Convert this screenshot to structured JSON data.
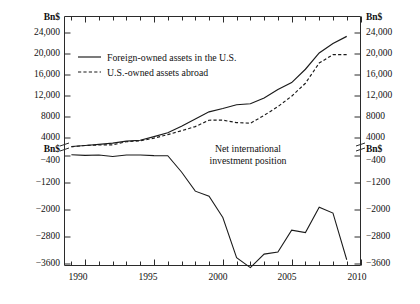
{
  "chart_data": {
    "type": "line",
    "title": "",
    "xlabel": "",
    "ylabel": "Bn$",
    "unit_label": "Bn$",
    "grid": false,
    "legend_position": "upper-left-inside",
    "axis_break": true,
    "axis_break_note": "Y axis broken between 4000 and -400; 'Bn$' unit label repeated at each segment top",
    "xlim": [
      1988.5,
      2010
    ],
    "x_major_ticks": [
      1990,
      1995,
      2000,
      2005,
      2010
    ],
    "x_major_tick_labels": [
      "1990",
      "1995",
      "2000",
      "2005",
      "2010"
    ],
    "x_minor_tick_step": 1,
    "y_upper_ticks": [
      4000,
      8000,
      12000,
      16000,
      20000,
      24000
    ],
    "y_upper_tick_labels": [
      "4000",
      "8000",
      "12,000",
      "16,000",
      "20,000",
      "24,000"
    ],
    "y_lower_ticks": [
      -400,
      -1200,
      -2000,
      -2800,
      -3600
    ],
    "y_lower_tick_labels": [
      "−400",
      "−1200",
      "−2000",
      "−2800",
      "−3600"
    ],
    "left_axis_unit": "Bn$",
    "right_axis_unit": "Bn$",
    "annotations": [
      {
        "text_line1": "Net international",
        "text_line2": "investment position",
        "x": 2001.2,
        "series": "Net international investment position"
      }
    ],
    "x": [
      1989,
      1990,
      1991,
      1992,
      1993,
      1994,
      1995,
      1996,
      1997,
      1998,
      1999,
      2000,
      2001,
      2002,
      2003,
      2004,
      2005,
      2006,
      2007,
      2008,
      2009
    ],
    "series": [
      {
        "name": "Foreign-owned assets in the U.S.",
        "style": "solid",
        "color": "#1a1a1a",
        "values": [
          1929,
          2179,
          2429,
          2744,
          3236,
          3451,
          4271,
          4988,
          6252,
          7615,
          8983,
          9616,
          10343,
          10515,
          11616,
          13219,
          14559,
          17098,
          20194,
          21980,
          23357
        ]
      },
      {
        "name": "U.S.-owned assets abroad",
        "style": "dashed",
        "color": "#1a1a1a",
        "values": [
          1838,
          2179,
          2286,
          2331,
          3091,
          3315,
          3964,
          4650,
          5379,
          6174,
          7390,
          7394,
          6930,
          6807,
          8309,
          9973,
          11962,
          14428,
          18278,
          19888,
          19883
        ]
      },
      {
        "name": "Net international investment position",
        "style": "solid",
        "color": "#1a1a1a",
        "values": [
          -91,
          -245,
          -143,
          -413,
          -145,
          -136,
          -307,
          -338,
          -873,
          -1441,
          -1593,
          -2222,
          -3413,
          -3708,
          -3307,
          -3246,
          -2597,
          -2670,
          -1916,
          -2093,
          -3474
        ]
      }
    ]
  },
  "legend": {
    "entries": [
      {
        "label": "Foreign-owned assets in the U.S.",
        "style": "solid"
      },
      {
        "label": "U.S.-owned assets abroad",
        "style": "dashed"
      }
    ]
  },
  "annotation": {
    "line1": "Net international",
    "line2": "investment position"
  }
}
